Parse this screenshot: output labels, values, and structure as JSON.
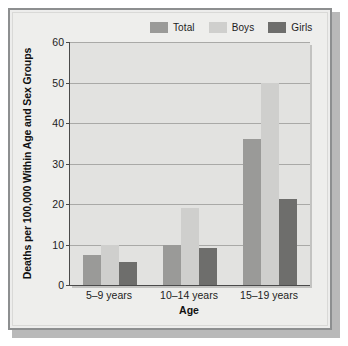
{
  "chart_data": {
    "type": "bar",
    "title": "",
    "subtitle": "",
    "xlabel": "Age",
    "ylabel": "Deaths per 100,000 Within Age and Sex Groups",
    "categories": [
      "5–9 years",
      "10–14 years",
      "15–19 years"
    ],
    "series": [
      {
        "name": "Total",
        "color": "#9a9a98",
        "values": [
          7.5,
          10.0,
          36.0
        ]
      },
      {
        "name": "Boys",
        "color": "#cfcfcd",
        "values": [
          10.0,
          19.0,
          50.0
        ]
      },
      {
        "name": "Girls",
        "color": "#6e6e6c",
        "values": [
          5.7,
          9.2,
          21.3
        ]
      }
    ],
    "ylim": [
      0,
      60
    ],
    "yticks": [
      0,
      10,
      20,
      30,
      40,
      50,
      60
    ],
    "ytick_labels": [
      "0",
      "10",
      "20",
      "30",
      "40",
      "50",
      "60"
    ],
    "grid": true,
    "grid_axis": "y",
    "legend_position": "top-right",
    "bar_gap_within_group": 0,
    "plot_background": "#e2e2e0",
    "figure_background": "#eeeeec",
    "axis_color": "#4a4a4a",
    "gridline_color": "#a9a9a7"
  },
  "legend": {
    "entries": [
      {
        "label": "Total"
      },
      {
        "label": "Boys"
      },
      {
        "label": "Girls"
      }
    ]
  },
  "axes": {
    "y_title": "Deaths per 100,000 Within Age and Sex Groups",
    "x_title": "Age"
  }
}
